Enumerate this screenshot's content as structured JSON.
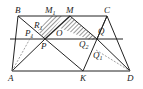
{
  "diagram": {
    "type": "geometry",
    "points": {
      "A": {
        "label": "A",
        "x": 12,
        "y": 71
      },
      "B": {
        "label": "B",
        "x": 18,
        "y": 16
      },
      "C": {
        "label": "C",
        "x": 107,
        "y": 16
      },
      "D": {
        "label": "D",
        "x": 130,
        "y": 71
      },
      "K": {
        "label": "K",
        "x": 83,
        "y": 71
      },
      "M": {
        "label": "M",
        "x": 70,
        "y": 16
      },
      "M1": {
        "label": "M",
        "sub": "1",
        "x": 50,
        "y": 16
      },
      "P": {
        "label": "P",
        "x": 45,
        "y": 39
      },
      "Q": {
        "label": "Q",
        "x": 97,
        "y": 39
      },
      "O": {
        "label": "O",
        "x": 58,
        "y": 30
      },
      "R": {
        "label": "R",
        "sub": "1",
        "x": 40,
        "y": 26
      },
      "P1": {
        "label": "P",
        "sub": "1",
        "x": 30,
        "y": 33
      },
      "Q1": {
        "label": "Q",
        "sub": "1",
        "x": 98,
        "y": 52
      },
      "Q2": {
        "label": "Q",
        "sub": "2",
        "x": 84,
        "y": 46
      }
    },
    "labels": {
      "A": "A",
      "B": "B",
      "C": "C",
      "D": "D",
      "K": "K",
      "M": "M",
      "M1": "M",
      "M1_sub": "1",
      "P": "P",
      "Q": "Q",
      "O": "O",
      "R1": "R",
      "R1_sub": "1",
      "P1": "P",
      "P1_sub": "1",
      "Q1": "Q",
      "Q1_sub": "1",
      "Q2": "Q",
      "Q2_sub": "2"
    },
    "colors": {
      "line": "#222222",
      "dashed": "#777777",
      "hatch": "#333333"
    }
  }
}
